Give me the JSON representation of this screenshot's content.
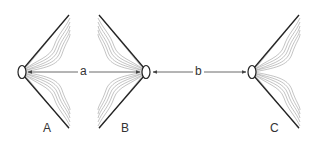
{
  "diagram": {
    "type": "optics-schematic",
    "figures": [
      {
        "id": "A",
        "label": "A",
        "ring": {
          "cx": 22,
          "cy": 72
        },
        "opens": "right",
        "tip_x": 69
      },
      {
        "id": "B",
        "label": "B",
        "ring": {
          "cx": 146,
          "cy": 72
        },
        "opens": "left",
        "tip_x": 101
      },
      {
        "id": "C",
        "label": "C",
        "ring": {
          "cx": 252,
          "cy": 72
        },
        "opens": "right",
        "tip_x": 298
      }
    ],
    "distances": [
      {
        "id": "a",
        "label": "a",
        "from": "A",
        "to": "B",
        "x1": 28,
        "x2": 140,
        "y": 72
      },
      {
        "id": "b",
        "label": "b",
        "from": "B",
        "to": "C",
        "x1": 153,
        "x2": 246,
        "y": 72
      }
    ],
    "colors": {
      "line": "#222222",
      "fan": "#9a9a9a",
      "arrow": "#444444"
    }
  }
}
